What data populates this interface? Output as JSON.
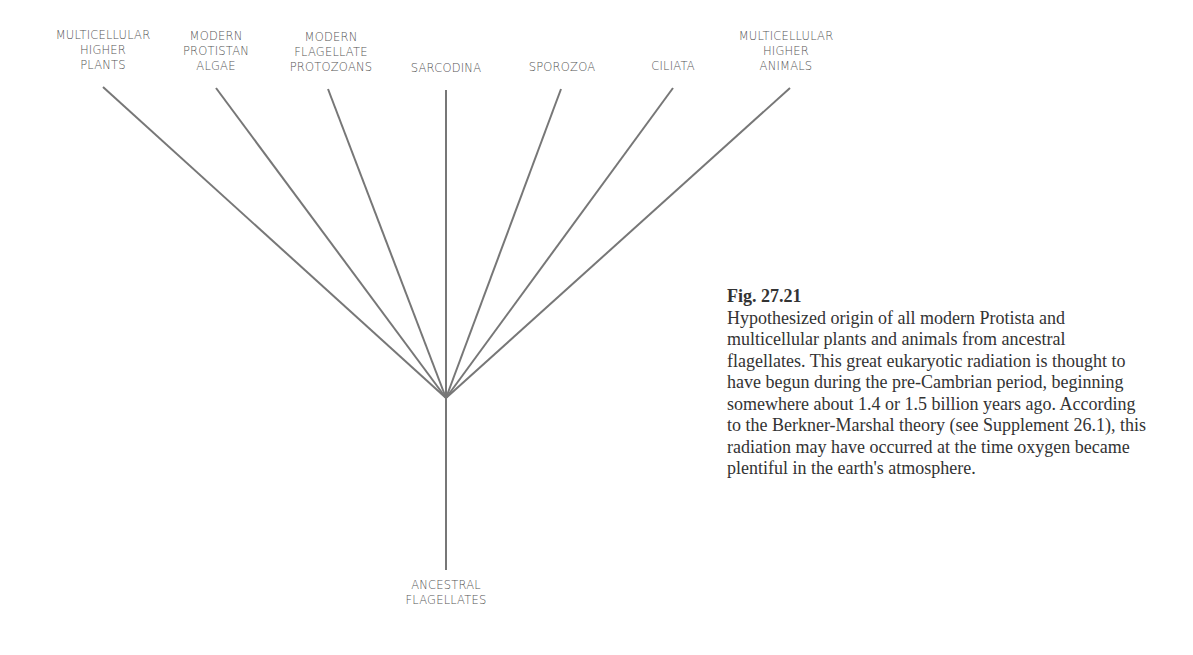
{
  "diagram": {
    "line_color": "#777777",
    "root": {
      "label_lines": [
        "ANCESTRAL",
        "FLAGELLATES"
      ]
    },
    "branches": [
      {
        "id": "plants",
        "label_lines": [
          "MULTICELLULAR",
          "HIGHER",
          "PLANTS"
        ]
      },
      {
        "id": "algae",
        "label_lines": [
          "MODERN",
          "PROTISTAN",
          "ALGAE"
        ]
      },
      {
        "id": "protozoans",
        "label_lines": [
          "MODERN",
          "FLAGELLATE",
          "PROTOZOANS"
        ]
      },
      {
        "id": "sarcodina",
        "label_lines": [
          "SARCODINA"
        ]
      },
      {
        "id": "sporozoa",
        "label_lines": [
          "SPOROZOA"
        ]
      },
      {
        "id": "ciliata",
        "label_lines": [
          "CILIATA"
        ]
      },
      {
        "id": "animals",
        "label_lines": [
          "MULTICELLULAR",
          "HIGHER",
          "ANIMALS"
        ]
      }
    ]
  },
  "caption": {
    "figure_number": "Fig. 27.21",
    "text": "Hypothesized origin of all modern Protista and multicellular plants and animals from ancestral flagellates. This great eukaryotic radiation is thought to have begun during the pre-Cambrian period, beginning somewhere about 1.4 or 1.5 billion years ago. According to the Berkner-Marshal theory (see Supplement 26.1), this radiation may have occurred at the time oxygen became plentiful in the earth's atmosphere."
  }
}
